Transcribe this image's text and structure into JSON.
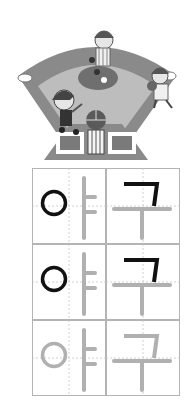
{
  "worksheet": {
    "word": "야구",
    "illustration": "baseball-field-players",
    "colors": {
      "grid_border": "#b4b4b4",
      "guide_dash": "#c4c4c4",
      "traced_stroke": "#111111",
      "guide_stroke": "#b0b0b0",
      "field_dark": "#8a8a8a",
      "field_light": "#bdbdbd"
    },
    "rows": [
      {
        "syllables": [
          {
            "char": "야",
            "traced": [
              "ieung"
            ]
          },
          {
            "char": "구",
            "traced": [
              "giyeok_top",
              "giyeok_right"
            ]
          }
        ]
      },
      {
        "syllables": [
          {
            "char": "야",
            "traced": [
              "ieung"
            ]
          },
          {
            "char": "구",
            "traced": [
              "giyeok_top",
              "giyeok_right"
            ]
          }
        ]
      },
      {
        "syllables": [
          {
            "char": "야",
            "traced": []
          },
          {
            "char": "구",
            "traced": []
          }
        ]
      }
    ]
  }
}
